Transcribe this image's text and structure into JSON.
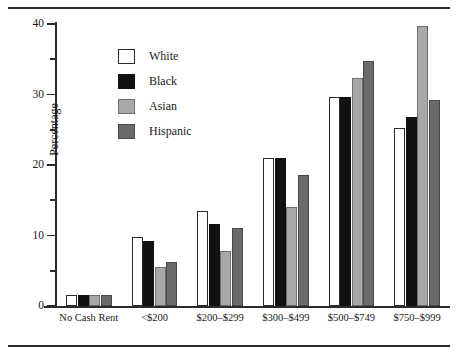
{
  "chart_data": {
    "type": "bar",
    "title": "",
    "xlabel": "",
    "ylabel": "Percentage",
    "ylim": [
      0,
      40
    ],
    "yticks": [
      0,
      10,
      20,
      30,
      40
    ],
    "yticks_minor": [
      5,
      15,
      25,
      35
    ],
    "grid": false,
    "legend_position": "upper-left-inside",
    "categories": [
      "No Cash Rent",
      "<$200",
      "$200–$299",
      "$300–$499",
      "$500–$749",
      "$750–$999"
    ],
    "series": [
      {
        "name": "White",
        "color": "#ffffff",
        "values": [
          1.5,
          9.8,
          13.5,
          21.0,
          29.7,
          25.3
        ]
      },
      {
        "name": "Black",
        "color": "#111111",
        "values": [
          1.5,
          9.2,
          11.7,
          21.0,
          29.7,
          26.8
        ]
      },
      {
        "name": "Asian",
        "color": "#a8a8a8",
        "values": [
          1.5,
          5.5,
          7.8,
          14.0,
          32.4,
          39.7
        ]
      },
      {
        "name": "Hispanic",
        "color": "#6b6b6b",
        "values": [
          1.5,
          6.2,
          11.0,
          18.6,
          34.8,
          29.2
        ]
      }
    ]
  },
  "axis": {
    "y_title": "Percentage",
    "y_tick_labels": [
      "0",
      "10",
      "20",
      "30",
      "40"
    ]
  },
  "legend": {
    "items": [
      {
        "label": "White",
        "swatch": "white-swatch-icon"
      },
      {
        "label": "Black",
        "swatch": "black-swatch-icon"
      },
      {
        "label": "Asian",
        "swatch": "asian-swatch-icon"
      },
      {
        "label": "Hispanic",
        "swatch": "hispanic-swatch-icon"
      }
    ]
  }
}
